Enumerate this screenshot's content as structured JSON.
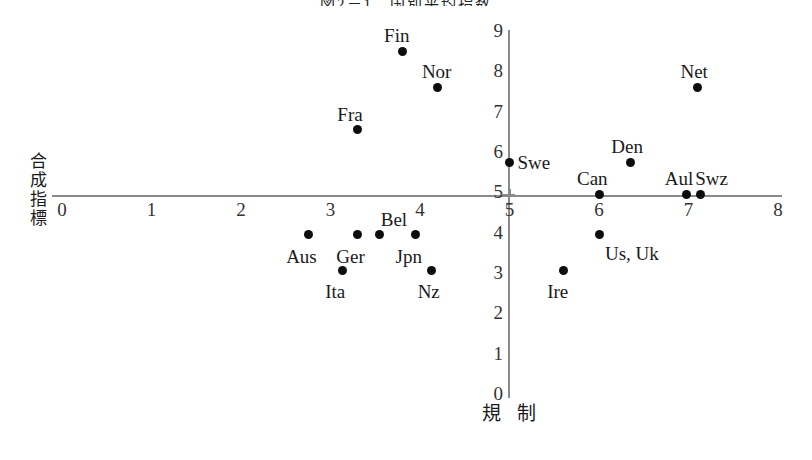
{
  "figure": {
    "title": "図2－1　国別平均指数",
    "x_axis_label": "規 制",
    "y_axis_label_chars": [
      "合",
      "成",
      "指",
      "標"
    ],
    "dot_color": "#0d0d0d",
    "axis_color": "#8a8a8a"
  },
  "chart_data": {
    "type": "scatter",
    "title": "図2－1　国別平均指数",
    "xlabel": "規 制",
    "ylabel": "合成指標",
    "xlim": [
      0,
      8
    ],
    "ylim": [
      0,
      9
    ],
    "xticks": [
      0,
      1,
      2,
      3,
      4,
      5,
      6,
      7,
      8
    ],
    "yticks": [
      0,
      1,
      2,
      3,
      4,
      5,
      6,
      7,
      8,
      9
    ],
    "grid": false,
    "legend": "none",
    "axis_origin": [
      5,
      5
    ],
    "points": [
      {
        "label": "Fin",
        "x": 3.8,
        "y": 8.55,
        "label_dx": -18,
        "label_dy": -26
      },
      {
        "label": "Nor",
        "x": 4.2,
        "y": 7.65,
        "label_dx": -16,
        "label_dy": -26
      },
      {
        "label": "Fra",
        "x": 3.3,
        "y": 6.6,
        "label_dx": -20,
        "label_dy": -26
      },
      {
        "label": "Net",
        "x": 7.1,
        "y": 7.65,
        "label_dx": -17,
        "label_dy": -26
      },
      {
        "label": "Den",
        "x": 6.35,
        "y": 5.8,
        "label_dx": -19,
        "label_dy": -26
      },
      {
        "label": "Swe",
        "x": 5.0,
        "y": 5.8,
        "label_dx": 8,
        "label_dy": -10
      },
      {
        "label": "Can",
        "x": 6.0,
        "y": 5.0,
        "label_dx": -22,
        "label_dy": -26
      },
      {
        "label": "Aul",
        "x": 6.98,
        "y": 5.0,
        "label_dx": -22,
        "label_dy": -26
      },
      {
        "label": "Swz",
        "x": 7.13,
        "y": 5.0,
        "label_dx": -5,
        "label_dy": -26
      },
      {
        "label": "Bel",
        "x": 3.55,
        "y": 4.0,
        "label_dx": 1,
        "label_dy": -26
      },
      {
        "label": "Ger",
        "x": 3.3,
        "y": 4.0,
        "label_dx": -21,
        "label_dy": 11
      },
      {
        "label": "Jpn",
        "x": 3.95,
        "y": 4.0,
        "label_dx": -20,
        "label_dy": 11
      },
      {
        "label": "Aus",
        "x": 2.75,
        "y": 4.0,
        "label_dx": -22,
        "label_dy": 11
      },
      {
        "label": "Us, Uk",
        "x": 6.0,
        "y": 4.0,
        "label_dx": 6,
        "label_dy": 8
      },
      {
        "label": "Ita",
        "x": 3.13,
        "y": 3.1,
        "label_dx": -17,
        "label_dy": 10
      },
      {
        "label": "Nz",
        "x": 4.13,
        "y": 3.1,
        "label_dx": -14,
        "label_dy": 10
      },
      {
        "label": "Ire",
        "x": 5.6,
        "y": 3.1,
        "label_dx": -16,
        "label_dy": 10
      }
    ]
  }
}
